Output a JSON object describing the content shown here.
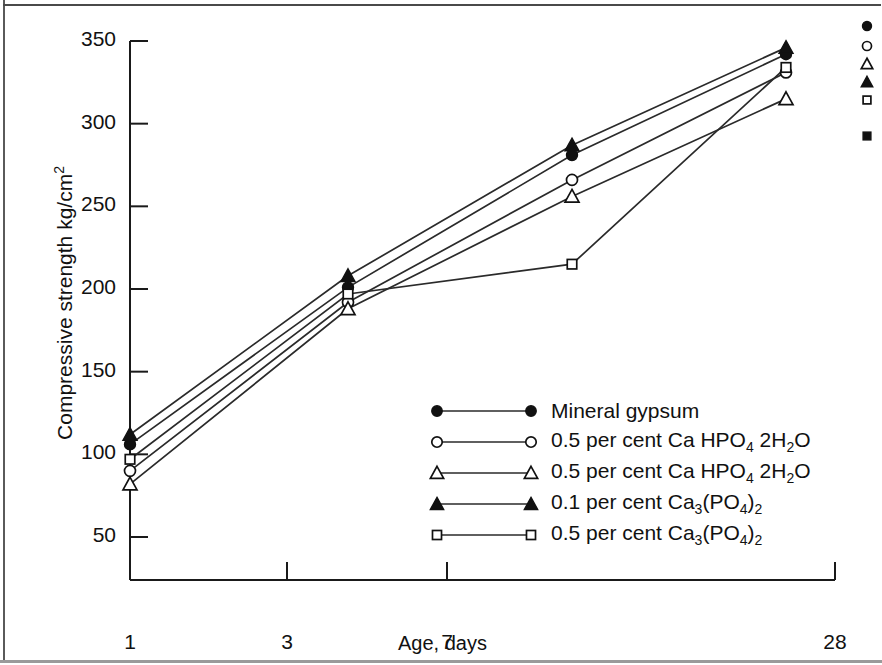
{
  "chart_data": {
    "type": "line",
    "title": "",
    "xlabel": "Age, days",
    "ylabel": "Compressive strength kg/cm2",
    "ylabel_base": "Compressive strength kg/cm",
    "ylabel_exponent": "2",
    "x_tick_labels": [
      "1",
      "3",
      "7",
      "28"
    ],
    "x_values": [
      1,
      3,
      7,
      28
    ],
    "y_tick_labels": [
      "50",
      "100",
      "150",
      "200",
      "250",
      "300",
      "350"
    ],
    "y_ticks": [
      50,
      100,
      150,
      200,
      250,
      300,
      350
    ],
    "ylim": [
      50,
      350
    ],
    "grid": false,
    "legend_position": "center",
    "series": [
      {
        "name": "Mineral gypsum",
        "marker": "filled-circle",
        "values": [
          106,
          201,
          281,
          342
        ]
      },
      {
        "name": "0.5 per cent Ca HPO4 2H2O",
        "label_parts": [
          "0.5 per cent Ca HPO",
          "4",
          " 2H",
          "2",
          "O"
        ],
        "marker": "open-circle",
        "values": [
          90,
          192,
          266,
          331
        ]
      },
      {
        "name": "0.5 per cent Ca HPO4 2H2O",
        "label_parts": [
          "0.5 per cent Ca HPO",
          "4",
          " 2H",
          "2",
          "O"
        ],
        "marker": "open-triangle",
        "values": [
          82,
          188,
          256,
          315
        ]
      },
      {
        "name": "0.1 per cent Ca3(PO4)2",
        "label_parts": [
          "0.1 per cent Ca",
          "3",
          "(PO",
          "4",
          ")",
          "2"
        ],
        "marker": "filled-triangle",
        "values": [
          112,
          208,
          287,
          346
        ]
      },
      {
        "name": "0.5 per cent Ca3(PO4)2",
        "label_parts": [
          "0.5 per cent Ca",
          "3",
          "(PO",
          "4",
          ")",
          "2"
        ],
        "marker": "open-square",
        "values": [
          97,
          197,
          215,
          334
        ]
      }
    ]
  },
  "legend": {
    "items": [
      {
        "label": "Mineral gypsum",
        "marker": "filled-circle"
      },
      {
        "label": "0.5 per cent Ca HPO4 2H2O",
        "marker": "open-circle"
      },
      {
        "label": "0.5 per cent Ca HPO4 2H2O",
        "marker": "open-triangle"
      },
      {
        "label": "0.1 per cent Ca3(PO4)2",
        "marker": "filled-triangle"
      },
      {
        "label": "0.5 per cent Ca3(PO4)2",
        "marker": "open-square"
      }
    ]
  },
  "orphan_markers": [
    "filled-circle",
    "open-circle",
    "open-triangle",
    "filled-triangle",
    "open-square",
    "filled-square"
  ],
  "colors": {
    "line": "#2a2a2a",
    "axis": "#1a1a1a",
    "text": "#111111",
    "background": "#ffffff"
  }
}
